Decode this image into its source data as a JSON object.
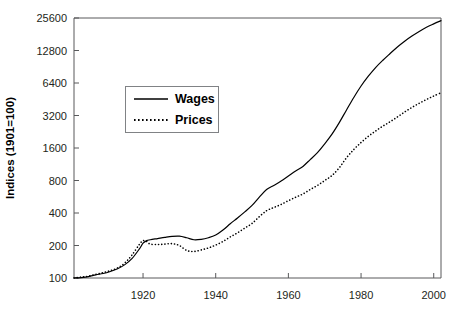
{
  "chart_data": {
    "type": "line",
    "title": "",
    "xlabel": "",
    "ylabel": "Indices (1901=100)",
    "xlim": [
      1901,
      2002
    ],
    "ylim": [
      100,
      25600
    ],
    "yscale": "log2",
    "grid": false,
    "legend_position": "upper-left-inside",
    "xticks": [
      1920,
      1940,
      1960,
      1980,
      2000
    ],
    "xtick_labels": [
      "1920",
      "1940",
      "1960",
      "1980",
      "2000"
    ],
    "yticks": [
      100,
      200,
      400,
      800,
      1600,
      3200,
      6400,
      12800,
      25600
    ],
    "ytick_labels": [
      "100",
      "200",
      "400",
      "800",
      "1600",
      "3200",
      "6400",
      "12800",
      "25600"
    ],
    "series": [
      {
        "name": "Wages",
        "style": "solid",
        "color": "#000000",
        "x": [
          1901,
          1903,
          1905,
          1907,
          1909,
          1911,
          1913,
          1915,
          1917,
          1919,
          1920,
          1921,
          1922,
          1924,
          1926,
          1928,
          1930,
          1932,
          1934,
          1936,
          1938,
          1940,
          1942,
          1944,
          1946,
          1948,
          1950,
          1952,
          1954,
          1956,
          1958,
          1960,
          1962,
          1964,
          1966,
          1968,
          1970,
          1972,
          1974,
          1976,
          1978,
          1980,
          1982,
          1984,
          1986,
          1988,
          1990,
          1992,
          1994,
          1996,
          1998,
          2000,
          2002
        ],
        "y": [
          100,
          101,
          103,
          107,
          110,
          115,
          122,
          133,
          152,
          186,
          210,
          222,
          226,
          232,
          238,
          243,
          244,
          236,
          226,
          228,
          236,
          250,
          278,
          318,
          360,
          410,
          470,
          560,
          660,
          720,
          790,
          880,
          980,
          1080,
          1250,
          1450,
          1750,
          2150,
          2750,
          3600,
          4700,
          6000,
          7400,
          8900,
          10400,
          12000,
          13800,
          15600,
          17400,
          19200,
          21000,
          22600,
          24200
        ]
      },
      {
        "name": "Prices",
        "style": "dotted",
        "color": "#000000",
        "x": [
          1901,
          1903,
          1905,
          1907,
          1909,
          1911,
          1913,
          1915,
          1917,
          1919,
          1920,
          1921,
          1922,
          1924,
          1926,
          1928,
          1930,
          1932,
          1934,
          1936,
          1938,
          1940,
          1942,
          1944,
          1946,
          1948,
          1950,
          1952,
          1954,
          1956,
          1958,
          1960,
          1962,
          1964,
          1966,
          1968,
          1970,
          1972,
          1974,
          1976,
          1978,
          1980,
          1982,
          1984,
          1986,
          1988,
          1990,
          1992,
          1994,
          1996,
          1998,
          2000,
          2002
        ],
        "y": [
          100,
          102,
          104,
          108,
          112,
          117,
          124,
          138,
          164,
          205,
          222,
          218,
          206,
          204,
          206,
          208,
          200,
          180,
          176,
          182,
          190,
          202,
          218,
          240,
          262,
          290,
          320,
          370,
          420,
          450,
          480,
          520,
          560,
          600,
          660,
          720,
          800,
          890,
          1050,
          1300,
          1550,
          1800,
          2050,
          2300,
          2550,
          2800,
          3100,
          3450,
          3800,
          4150,
          4500,
          4850,
          5200
        ]
      }
    ]
  },
  "legend": {
    "entries": [
      {
        "label": "Wages",
        "style": "solid"
      },
      {
        "label": "Prices",
        "style": "dotted"
      }
    ]
  },
  "colors": {
    "axis": "#58595b",
    "text": "#231f20",
    "series": "#000000",
    "background": "#ffffff"
  }
}
